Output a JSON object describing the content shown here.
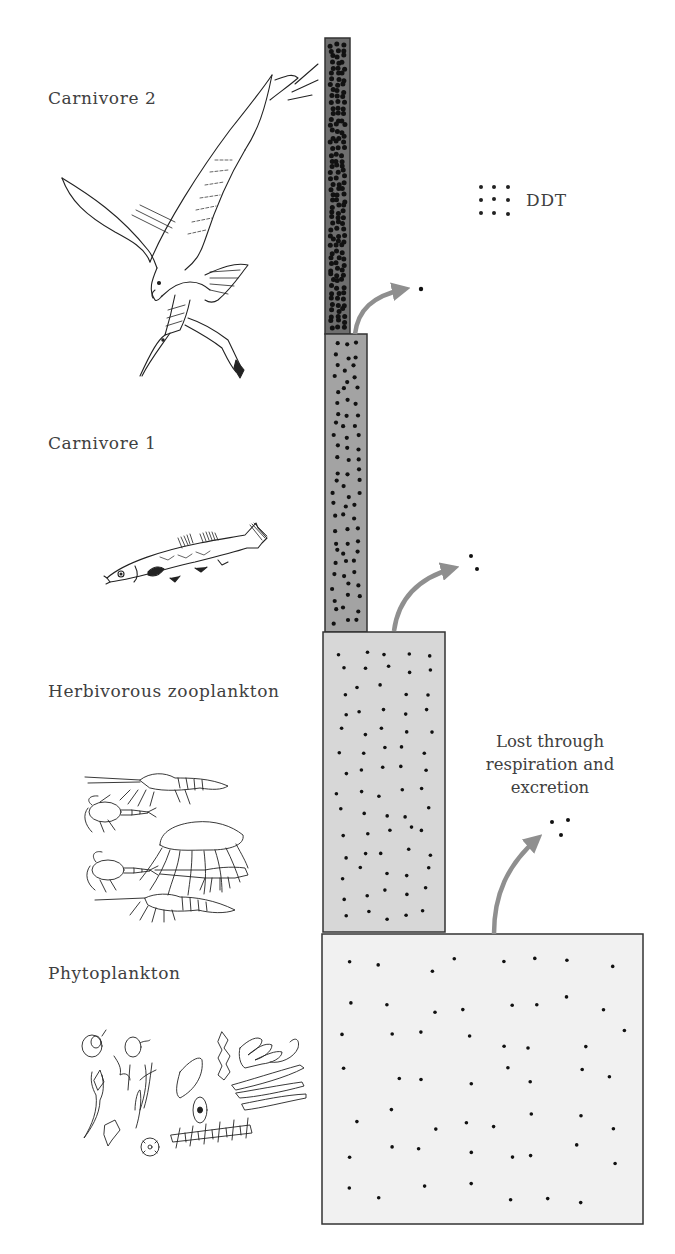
{
  "diagram": {
    "legend": {
      "symbol": "dot-grid-icon",
      "label": "DDT"
    },
    "levels": [
      {
        "id": "carnivore2",
        "label": "Carnivore 2",
        "organism": "osprey",
        "relative_biomass": 1,
        "relative_ddt_concentration": "highest",
        "fill": "#6e6e6e"
      },
      {
        "id": "carnivore1",
        "label": "Carnivore 1",
        "organism": "fish",
        "relative_biomass": 1.7,
        "relative_ddt_concentration": "high",
        "fill": "#a3a3a3"
      },
      {
        "id": "zooplankton",
        "label": "Herbivorous zooplankton",
        "organism": "zooplankton",
        "relative_biomass": 4.9,
        "relative_ddt_concentration": "medium",
        "fill": "#d7d7d7"
      },
      {
        "id": "phytoplankton",
        "label": "Phytoplankton",
        "organism": "phytoplankton",
        "relative_biomass": 12.8,
        "relative_ddt_concentration": "low",
        "fill": "#f1f1f1"
      }
    ],
    "losses": {
      "label_lines": [
        "Lost through",
        "respiration and",
        "excretion"
      ],
      "arrow_color": "#8f8f8f"
    }
  }
}
